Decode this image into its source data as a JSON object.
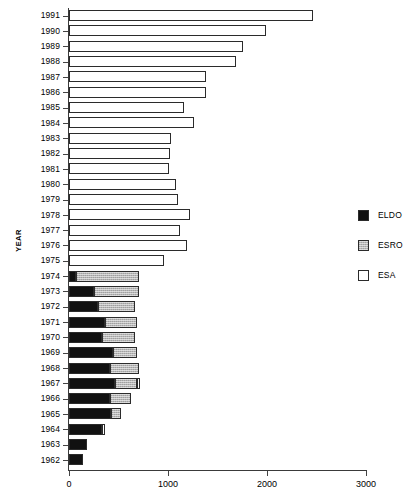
{
  "chart_data": {
    "type": "bar",
    "orientation": "horizontal",
    "stacked": true,
    "title": "",
    "xlabel": "",
    "ylabel": "YEAR",
    "xlim": [
      0,
      3000
    ],
    "xticks": [
      0,
      1000,
      2000,
      3000
    ],
    "xticklabels": [
      "0",
      "1000",
      "2000",
      "3000"
    ],
    "grid": false,
    "legend_position": "right",
    "categories": [
      "1991",
      "1990",
      "1989",
      "1988",
      "1987",
      "1986",
      "1985",
      "1984",
      "1983",
      "1982",
      "1981",
      "1980",
      "1979",
      "1978",
      "1977",
      "1976",
      "1975",
      "1974",
      "1973",
      "1972",
      "1971",
      "1970",
      "1969",
      "1968",
      "1967",
      "1966",
      "1965",
      "1964",
      "1963",
      "1962"
    ],
    "series": [
      {
        "name": "ELDO",
        "color": "#111111",
        "values": [
          0,
          0,
          0,
          0,
          0,
          0,
          0,
          0,
          0,
          0,
          0,
          0,
          0,
          0,
          0,
          0,
          0,
          70,
          250,
          290,
          360,
          330,
          440,
          410,
          465,
          415,
          425,
          335,
          180,
          145
        ]
      },
      {
        "name": "ESRO",
        "color": "#b6b6b6",
        "values": [
          0,
          0,
          0,
          0,
          0,
          0,
          0,
          0,
          0,
          0,
          0,
          0,
          0,
          0,
          0,
          0,
          0,
          640,
          460,
          375,
          330,
          335,
          250,
          300,
          225,
          210,
          100,
          0,
          0,
          0
        ]
      },
      {
        "name": "ESA",
        "color": "#ffffff",
        "values": [
          2465,
          1990,
          1760,
          1690,
          1380,
          1380,
          1160,
          1260,
          1030,
          1020,
          1010,
          1080,
          1100,
          1220,
          1120,
          1190,
          960,
          0,
          0,
          0,
          0,
          0,
          0,
          0,
          25,
          0,
          0,
          25,
          0,
          0
        ]
      }
    ],
    "totals": [
      2465,
      1990,
      1760,
      1690,
      1380,
      1380,
      1160,
      1260,
      1030,
      1020,
      1010,
      1080,
      1100,
      1220,
      1120,
      1190,
      960,
      710,
      710,
      665,
      690,
      665,
      690,
      710,
      690,
      625,
      525,
      360,
      180,
      145
    ]
  },
  "legend": {
    "items": [
      {
        "label": "ELDO",
        "swatch": "black-swatch"
      },
      {
        "label": "ESRO",
        "swatch": "gray-swatch"
      },
      {
        "label": "ESA",
        "swatch": "white-swatch"
      }
    ]
  }
}
